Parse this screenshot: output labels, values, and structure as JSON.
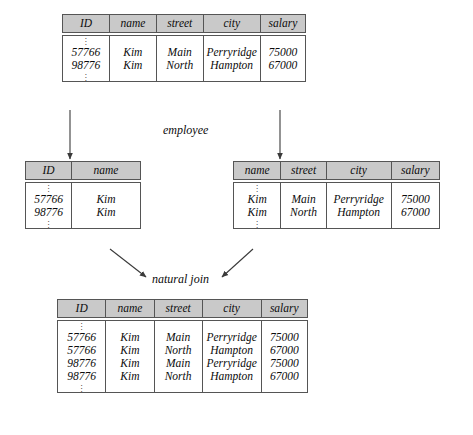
{
  "diagram": {
    "title_caption": "employee",
    "operation_caption": "natural join",
    "ellipsis_glyph": "vertical-ellipsis"
  },
  "employee_table": {
    "name": "employee",
    "columns": [
      "ID",
      "name",
      "street",
      "city",
      "salary"
    ],
    "rows": [
      [
        "57766",
        "Kim",
        "Main",
        "Perryridge",
        "75000"
      ],
      [
        "98776",
        "Kim",
        "North",
        "Hampton",
        "67000"
      ]
    ]
  },
  "projection_left": {
    "columns": [
      "ID",
      "name"
    ],
    "rows": [
      [
        "57766",
        "Kim"
      ],
      [
        "98776",
        "Kim"
      ]
    ]
  },
  "projection_right": {
    "columns": [
      "name",
      "street",
      "city",
      "salary"
    ],
    "rows": [
      [
        "Kim",
        "Main",
        "Perryridge",
        "75000"
      ],
      [
        "Kim",
        "North",
        "Hampton",
        "67000"
      ]
    ]
  },
  "result_table": {
    "columns": [
      "ID",
      "name",
      "street",
      "city",
      "salary"
    ],
    "rows": [
      [
        "57766",
        "Kim",
        "Main",
        "Perryridge",
        "75000"
      ],
      [
        "57766",
        "Kim",
        "North",
        "Hampton",
        "67000"
      ],
      [
        "98776",
        "Kim",
        "Main",
        "Perryridge",
        "75000"
      ],
      [
        "98776",
        "Kim",
        "North",
        "Hampton",
        "67000"
      ]
    ]
  },
  "colors": {
    "header_fill": "#c9c9c9",
    "border": "#555555",
    "text": "#0c0c0c",
    "background": "#ffffff"
  }
}
